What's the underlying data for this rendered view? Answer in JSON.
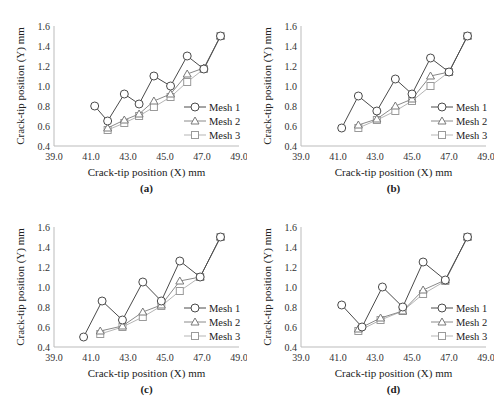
{
  "chart_data": [
    {
      "type": "line",
      "panel_label": "(a)",
      "xlabel": "Crack-tip position (X) mm",
      "ylabel": "Crack-tip position (Y) mm",
      "xlim": [
        39.0,
        49.0
      ],
      "ylim": [
        0.4,
        1.6
      ],
      "xticks": [
        "39.0",
        "41.0",
        "43.0",
        "45.0",
        "47.0",
        "49.0"
      ],
      "yticks": [
        "0.4",
        "0.6",
        "0.8",
        "1.0",
        "1.2",
        "1.4",
        "1.6"
      ],
      "grid": false,
      "legend_position": "lower right",
      "series": [
        {
          "name": "Mesh 1",
          "marker": "circle",
          "x": [
            41.2,
            41.9,
            42.8,
            43.6,
            44.4,
            45.3,
            46.2,
            47.1,
            48.0
          ],
          "y": [
            0.8,
            0.65,
            0.92,
            0.82,
            1.1,
            1.0,
            1.3,
            1.17,
            1.5
          ]
        },
        {
          "name": "Mesh 2",
          "marker": "triangle",
          "x": [
            41.9,
            42.8,
            43.6,
            44.4,
            45.3,
            46.2,
            47.1,
            48.0
          ],
          "y": [
            0.58,
            0.66,
            0.72,
            0.85,
            0.92,
            1.12,
            1.18,
            1.5
          ]
        },
        {
          "name": "Mesh 3",
          "marker": "square",
          "x": [
            41.9,
            42.8,
            43.6,
            44.4,
            45.3,
            46.2,
            47.1,
            48.0
          ],
          "y": [
            0.56,
            0.63,
            0.7,
            0.79,
            0.89,
            1.04,
            1.17,
            1.5
          ]
        }
      ]
    },
    {
      "type": "line",
      "panel_label": "(b)",
      "xlabel": "Crack-tip position (X) mm",
      "ylabel": "Crack-tip position (Y) mm",
      "xlim": [
        39.0,
        49.0
      ],
      "ylim": [
        0.4,
        1.6
      ],
      "xticks": [
        "39.0",
        "41.0",
        "43.0",
        "45.0",
        "47.0",
        "49.0"
      ],
      "yticks": [
        "0.4",
        "0.6",
        "0.8",
        "1.0",
        "1.2",
        "1.4",
        "1.6"
      ],
      "grid": false,
      "legend_position": "lower right",
      "series": [
        {
          "name": "Mesh 1",
          "marker": "circle",
          "x": [
            41.2,
            42.1,
            43.1,
            44.1,
            45.0,
            46.0,
            47.0,
            48.0
          ],
          "y": [
            0.58,
            0.9,
            0.75,
            1.07,
            0.92,
            1.28,
            1.14,
            1.5
          ]
        },
        {
          "name": "Mesh 2",
          "marker": "triangle",
          "x": [
            42.1,
            43.1,
            44.1,
            45.0,
            46.0,
            47.0,
            48.0
          ],
          "y": [
            0.61,
            0.67,
            0.8,
            0.87,
            1.1,
            1.14,
            1.5
          ]
        },
        {
          "name": "Mesh 3",
          "marker": "square",
          "x": [
            42.1,
            43.1,
            44.1,
            45.0,
            46.0,
            47.0,
            48.0
          ],
          "y": [
            0.58,
            0.66,
            0.75,
            0.85,
            1.0,
            1.14,
            1.5
          ]
        }
      ]
    },
    {
      "type": "line",
      "panel_label": "(c)",
      "xlabel": "Crack-tip position (X) mm",
      "ylabel": "Crack-tip position (Y) mm",
      "xlim": [
        39.0,
        49.0
      ],
      "ylim": [
        0.4,
        1.6
      ],
      "xticks": [
        "39.0",
        "41.0",
        "43.0",
        "45.0",
        "47.0",
        "49.0"
      ],
      "yticks": [
        "0.4",
        "0.6",
        "0.8",
        "1.0",
        "1.2",
        "1.4",
        "1.6"
      ],
      "grid": false,
      "legend_position": "lower right",
      "series": [
        {
          "name": "Mesh 1",
          "marker": "circle",
          "x": [
            40.6,
            41.6,
            42.7,
            43.8,
            44.8,
            45.8,
            46.9,
            48.0
          ],
          "y": [
            0.5,
            0.86,
            0.67,
            1.05,
            0.86,
            1.26,
            1.1,
            1.5
          ]
        },
        {
          "name": "Mesh 2",
          "marker": "triangle",
          "x": [
            41.5,
            42.7,
            43.8,
            44.8,
            45.8,
            46.9,
            48.0
          ],
          "y": [
            0.56,
            0.61,
            0.75,
            0.82,
            1.06,
            1.1,
            1.5
          ]
        },
        {
          "name": "Mesh 3",
          "marker": "square",
          "x": [
            41.5,
            42.7,
            43.8,
            44.8,
            45.8,
            46.9,
            48.0
          ],
          "y": [
            0.53,
            0.6,
            0.7,
            0.81,
            0.96,
            1.1,
            1.5
          ]
        }
      ]
    },
    {
      "type": "line",
      "panel_label": "(d)",
      "xlabel": "Crack-tip position (X) mm",
      "ylabel": "Crack-tip position (Y) mm",
      "xlim": [
        39.0,
        49.0
      ],
      "ylim": [
        0.4,
        1.6
      ],
      "xticks": [
        "39.0",
        "41.0",
        "43.0",
        "45.0",
        "47.0",
        "49.0"
      ],
      "yticks": [
        "0.4",
        "0.6",
        "0.8",
        "1.0",
        "1.2",
        "1.4",
        "1.6"
      ],
      "grid": false,
      "legend_position": "lower right",
      "series": [
        {
          "name": "Mesh 1",
          "marker": "circle",
          "x": [
            41.2,
            42.3,
            43.4,
            44.5,
            45.6,
            46.8,
            48.0
          ],
          "y": [
            0.82,
            0.6,
            1.0,
            0.8,
            1.25,
            1.07,
            1.5
          ]
        },
        {
          "name": "Mesh 2",
          "marker": "triangle",
          "x": [
            42.1,
            43.3,
            44.5,
            45.6,
            46.8,
            48.0
          ],
          "y": [
            0.58,
            0.69,
            0.76,
            0.97,
            1.07,
            1.5
          ]
        },
        {
          "name": "Mesh 3",
          "marker": "square",
          "x": [
            42.1,
            43.3,
            44.5,
            45.6,
            46.8,
            48.0
          ],
          "y": [
            0.56,
            0.67,
            0.76,
            0.93,
            1.06,
            1.5
          ]
        }
      ]
    }
  ]
}
